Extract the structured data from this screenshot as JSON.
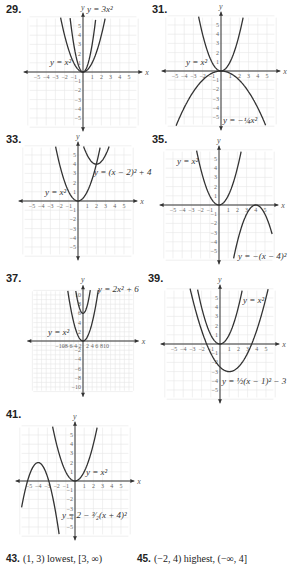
{
  "problems": [
    {
      "num": "29.",
      "label_x": 6,
      "label_y": 3,
      "ox": 83,
      "oy": 72,
      "unit": 9.2,
      "range": 5,
      "tick_step": 1,
      "tick_label_step": 1,
      "curves": [
        {
          "name": "y = x^2",
          "a": 1,
          "h": 0,
          "k": 0
        },
        {
          "name": "y = 3x^2",
          "a": 3,
          "h": 0,
          "k": 0
        }
      ],
      "labels": [
        {
          "text": "y = x²",
          "x": 50,
          "y": 65
        },
        {
          "text": "y = 3x²",
          "x": 87,
          "y": 12
        }
      ]
    },
    {
      "num": "31.",
      "label_x": 152,
      "label_y": 3,
      "ox": 221,
      "oy": 71,
      "unit": 9.2,
      "range": 5,
      "tick_step": 1,
      "tick_label_step": 1,
      "curves": [
        {
          "name": "y = x^2",
          "a": 1,
          "h": 0,
          "k": 0
        },
        {
          "name": "y = -1/4 x^2",
          "a": -0.25,
          "h": 0,
          "k": 0
        }
      ],
      "labels": [
        {
          "text": "y = x²",
          "x": 186,
          "y": 65
        },
        {
          "text": "y = −¼x²",
          "x": 223,
          "y": 123
        }
      ]
    },
    {
      "num": "33.",
      "label_x": 6,
      "label_y": 133,
      "ox": 78,
      "oy": 201,
      "unit": 9.2,
      "range": 5,
      "tick_step": 1,
      "tick_label_step": 1,
      "curves": [
        {
          "name": "y = x^2",
          "a": 1,
          "h": 0,
          "k": 0
        },
        {
          "name": "y = (x-2)^2 + 4",
          "a": 1,
          "h": 2,
          "k": 4
        }
      ],
      "labels": [
        {
          "text": "y = x²",
          "x": 45,
          "y": 195
        },
        {
          "text": "y = (x − 2)² + 4",
          "x": 94,
          "y": 175
        }
      ]
    },
    {
      "num": "35.",
      "label_x": 152,
      "label_y": 133,
      "ox": 219,
      "oy": 205,
      "unit": 9.2,
      "range": 5,
      "tick_step": 1,
      "tick_label_step": 1,
      "curves": [
        {
          "name": "y = x^2",
          "a": 1,
          "h": 0,
          "k": 0
        },
        {
          "name": "y = -(x-4)^2",
          "a": -1,
          "h": 4,
          "k": 0
        }
      ],
      "labels": [
        {
          "text": "y = x²",
          "x": 177,
          "y": 164
        },
        {
          "text": "y = −(x − 4)²",
          "x": 238,
          "y": 259
        }
      ]
    },
    {
      "num": "37.",
      "label_x": 6,
      "label_y": 272,
      "ox": 83,
      "oy": 341,
      "unit": 4.6,
      "range": 10,
      "tick_step": 2,
      "tick_label_step": 2,
      "curves": [
        {
          "name": "y = x^2",
          "a": 1,
          "h": 0,
          "k": 0
        },
        {
          "name": "y = 2x^2 + 6",
          "a": 2,
          "h": 0,
          "k": 6
        }
      ],
      "labels": [
        {
          "text": "y = x²",
          "x": 48,
          "y": 335
        },
        {
          "text": "y = 2x² + 6",
          "x": 98,
          "y": 292
        }
      ]
    },
    {
      "num": "39.",
      "label_x": 148,
      "label_y": 272,
      "ox": 220,
      "oy": 344,
      "unit": 9.2,
      "range": 5,
      "tick_step": 1,
      "tick_label_step": 1,
      "curves": [
        {
          "name": "y = x^2",
          "a": 1,
          "h": 0,
          "k": 0
        },
        {
          "name": "y = 1/2 (x-1)^2 - 3",
          "a": 0.5,
          "h": 1,
          "k": -3
        }
      ],
      "labels": [
        {
          "text": "y = x²",
          "x": 243,
          "y": 303
        },
        {
          "text": "y = ½(x − 1)² − 3",
          "x": 222,
          "y": 384
        }
      ]
    },
    {
      "num": "41.",
      "label_x": 6,
      "label_y": 408,
      "ox": 75,
      "oy": 481,
      "unit": 9.2,
      "range": 5,
      "tick_step": 1,
      "tick_label_step": 1,
      "curves": [
        {
          "name": "y = x^2",
          "a": 1,
          "h": 0,
          "k": 0
        },
        {
          "name": "y = 2 - 3/2 (x+4)^2",
          "a": -1.5,
          "h": -4,
          "k": 2
        }
      ],
      "labels": [
        {
          "text": "y = x²",
          "x": 86,
          "y": 475
        },
        {
          "text": "y = 2 − ³⁄₂(x + 4)²",
          "x": 62,
          "y": 518
        }
      ]
    }
  ],
  "answers": [
    {
      "num": "43.",
      "text": "(1, 3) lowest, [3, ∞)",
      "x": 6,
      "y": 553
    },
    {
      "num": "45.",
      "text": "(−2, 4) highest, (−∞, 4]",
      "x": 137,
      "y": 553
    }
  ],
  "colors": {
    "curve": "#333333",
    "grid": "#e6e6e6",
    "axis": "#333333",
    "ticklabel": "#666666"
  }
}
